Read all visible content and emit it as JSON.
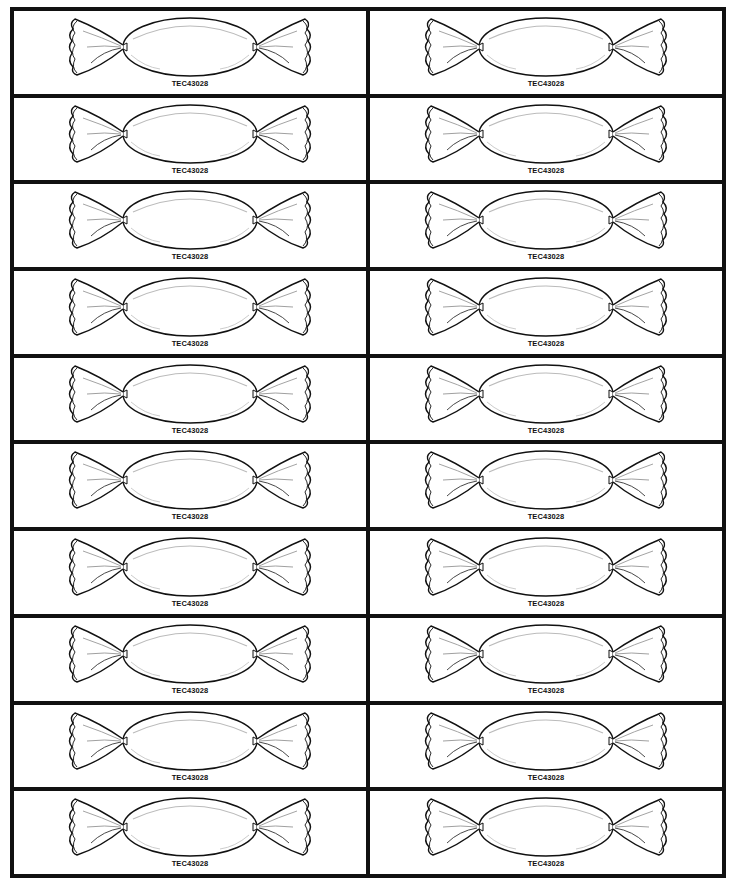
{
  "sheet": {
    "title": "Candy wrapper labels",
    "columns": 2,
    "rows": 10,
    "border_color": "#111111",
    "background": "#ffffff"
  },
  "labels": [
    {
      "code": "TEC43028",
      "icon": "candy-wrapper-icon"
    },
    {
      "code": "TEC43028",
      "icon": "candy-wrapper-icon"
    },
    {
      "code": "TEC43028",
      "icon": "candy-wrapper-icon"
    },
    {
      "code": "TEC43028",
      "icon": "candy-wrapper-icon"
    },
    {
      "code": "TEC43028",
      "icon": "candy-wrapper-icon"
    },
    {
      "code": "TEC43028",
      "icon": "candy-wrapper-icon"
    },
    {
      "code": "TEC43028",
      "icon": "candy-wrapper-icon"
    },
    {
      "code": "TEC43028",
      "icon": "candy-wrapper-icon"
    },
    {
      "code": "TEC43028",
      "icon": "candy-wrapper-icon"
    },
    {
      "code": "TEC43028",
      "icon": "candy-wrapper-icon"
    },
    {
      "code": "TEC43028",
      "icon": "candy-wrapper-icon"
    },
    {
      "code": "TEC43028",
      "icon": "candy-wrapper-icon"
    },
    {
      "code": "TEC43028",
      "icon": "candy-wrapper-icon"
    },
    {
      "code": "TEC43028",
      "icon": "candy-wrapper-icon"
    },
    {
      "code": "TEC43028",
      "icon": "candy-wrapper-icon"
    },
    {
      "code": "TEC43028",
      "icon": "candy-wrapper-icon"
    },
    {
      "code": "TEC43028",
      "icon": "candy-wrapper-icon"
    },
    {
      "code": "TEC43028",
      "icon": "candy-wrapper-icon"
    },
    {
      "code": "TEC43028",
      "icon": "candy-wrapper-icon"
    },
    {
      "code": "TEC43028",
      "icon": "candy-wrapper-icon"
    }
  ]
}
